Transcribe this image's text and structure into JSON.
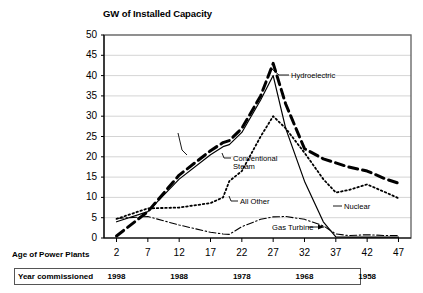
{
  "chart_data": {
    "type": "line",
    "title": "GW of Installed Capacity",
    "xlabel": "Age of Power Plants",
    "ylabel": "GW of Installed Capacity",
    "xlim": [
      0,
      49
    ],
    "ylim": [
      0,
      50
    ],
    "ytick_step": 5,
    "grid": true,
    "legend": "annotations-on-curves",
    "yticks": [
      "50",
      "45",
      "40",
      "35",
      "30",
      "25",
      "20",
      "15",
      "10",
      "5",
      "0"
    ],
    "xticks": [
      "2",
      "7",
      "12",
      "17",
      "22",
      "27",
      "32",
      "37",
      "42",
      "47"
    ],
    "x": [
      2,
      7,
      12,
      17,
      19,
      20,
      22,
      25,
      27,
      29,
      32,
      35,
      37,
      39,
      42,
      45,
      47
    ],
    "series": [
      {
        "name": "Total",
        "style": "thick-dashed",
        "annotation": "",
        "values": [
          0.5,
          6.5,
          15.5,
          21.5,
          23.5,
          24.0,
          27.0,
          35.0,
          43.0,
          33.0,
          22.0,
          19.5,
          18.5,
          17.5,
          16.5,
          14.5,
          13.5
        ]
      },
      {
        "name": "Hydroelectric",
        "style": "solid-thin",
        "annotation": "Hydroelectric",
        "values": [
          4.0,
          6.5,
          14.5,
          20.5,
          22.5,
          23.0,
          26.0,
          34.0,
          40.0,
          27.0,
          14.0,
          4.0,
          0.3,
          0.2,
          0.2,
          0.2,
          0.2
        ]
      },
      {
        "name": "Conventional Steam",
        "style": "dotted",
        "annotation": "Conventional\nSteam",
        "values": [
          4.7,
          7.3,
          7.5,
          8.6,
          10.0,
          14.0,
          16.5,
          25.0,
          30.0,
          27.0,
          21.0,
          14.5,
          11.2,
          11.8,
          13.2,
          11.2,
          9.8
        ]
      },
      {
        "name": "All Other / Gas Turbine",
        "style": "dash-dot",
        "annotation": "All Other",
        "annotation2": "Gas Turbine",
        "values": [
          4.8,
          5.3,
          3.2,
          1.4,
          1.0,
          0.9,
          2.8,
          4.6,
          5.2,
          5.3,
          4.6,
          3.0,
          1.0,
          0.6,
          0.8,
          0.6,
          0.6
        ]
      }
    ],
    "annotations": [
      {
        "label": "Hydroelectric",
        "target_x": 27,
        "target_y": 40
      },
      {
        "label": "Conventional Steam",
        "target_x": 22,
        "target_y": 17
      },
      {
        "label": "All Other",
        "target_x": 20,
        "target_y": 13
      },
      {
        "label": "Gas Turbine",
        "target_x": 34,
        "target_y": 4
      },
      {
        "label": "Nuclear",
        "target_x": 34,
        "target_y": 12
      }
    ]
  },
  "axis_rows": {
    "age_label": "Age of Power Plants",
    "year_label": "Year commissioned",
    "year_values": [
      "1998",
      "1988",
      "1978",
      "1968",
      "1958"
    ]
  },
  "colors": {
    "line": "#000000",
    "grid": "#c9c9c9",
    "frame": "#6a6a6a",
    "background": "#ffffff"
  }
}
